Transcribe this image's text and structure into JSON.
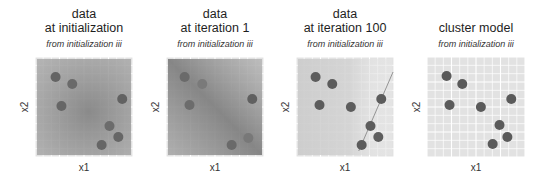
{
  "figure": {
    "point_color": "#5c5c5c",
    "point_radius": 5,
    "grid_bg": "#e2e2e2",
    "grid_line": "#ffffff",
    "boundary_color": "#8a8a8a"
  },
  "chart_data": [
    {
      "type": "scatter",
      "title": "data at initialization",
      "title_lines": [
        "data",
        "at initialization"
      ],
      "subtitle": "from initialization iii",
      "xlabel": "x1",
      "ylabel": "x2",
      "grid": true,
      "xlim": [
        0,
        1
      ],
      "ylim": [
        0,
        1
      ],
      "background": "radial-shading",
      "shading": {
        "kind": "radial",
        "cx": 0.55,
        "cy": 0.55,
        "r": 0.75,
        "stops": [
          [
            "0",
            "#828282",
            0.92
          ],
          [
            "1",
            "#a6a6a6",
            0.78
          ]
        ]
      },
      "points": [
        {
          "x": 0.21,
          "y": 0.8,
          "color": "#646464"
        },
        {
          "x": 0.38,
          "y": 0.73,
          "color": "#6a6a6a"
        },
        {
          "x": 0.27,
          "y": 0.51,
          "color": "#666666"
        },
        {
          "x": 0.89,
          "y": 0.58,
          "color": "#626262"
        },
        {
          "x": 0.76,
          "y": 0.31,
          "color": "#6c6c6c"
        },
        {
          "x": 0.85,
          "y": 0.2,
          "color": "#666666"
        },
        {
          "x": 0.68,
          "y": 0.12,
          "color": "#666666"
        }
      ]
    },
    {
      "type": "scatter",
      "title": "data at iteration 1",
      "title_lines": [
        "data",
        "at iteration 1"
      ],
      "subtitle": "from initialization iii",
      "xlabel": "x1",
      "ylabel": "x2",
      "grid": true,
      "xlim": [
        0,
        1
      ],
      "ylim": [
        0,
        1
      ],
      "background": "diagonal-shading",
      "shading": {
        "kind": "linear",
        "x1": 0,
        "y1": 1,
        "x2": 1,
        "y2": 0,
        "stops": [
          [
            "0",
            "#a6a6a6",
            0.85
          ],
          [
            "0.5",
            "#7e7e7e",
            0.92
          ],
          [
            "1",
            "#b4b4b4",
            0.8
          ]
        ]
      },
      "points": [
        {
          "x": 0.19,
          "y": 0.8,
          "color": "#6a6a6a"
        },
        {
          "x": 0.37,
          "y": 0.73,
          "color": "#7a7a7a"
        },
        {
          "x": 0.24,
          "y": 0.52,
          "color": "#6c6c6c"
        },
        {
          "x": 0.88,
          "y": 0.58,
          "color": "#606060"
        },
        {
          "x": 0.84,
          "y": 0.19,
          "color": "#787878"
        },
        {
          "x": 0.67,
          "y": 0.12,
          "color": "#6a6a6a"
        }
      ]
    },
    {
      "type": "scatter",
      "title": "data at iteration 100",
      "title_lines": [
        "data",
        "at iteration 100"
      ],
      "subtitle": "from initialization iii",
      "xlabel": "x1",
      "ylabel": "x2",
      "grid": true,
      "xlim": [
        0,
        1
      ],
      "ylim": [
        0,
        1
      ],
      "background": "light-shading",
      "shading": {
        "kind": "linear",
        "x1": 0,
        "y1": 0,
        "x2": 1,
        "y2": 0,
        "stops": [
          [
            "0",
            "#cbcbcb",
            0.9
          ],
          [
            "0.55",
            "#d2d2d2",
            0.85
          ],
          [
            "0.8",
            "#e3e3e3",
            0.6
          ],
          [
            "1",
            "#e6e6e6",
            0.5
          ]
        ]
      },
      "decision_boundary": {
        "x1": 0.64,
        "y1": 0.06,
        "x2": 0.99,
        "y2": 0.85
      },
      "points": [
        {
          "x": 0.2,
          "y": 0.8,
          "color": "#5c5c5c"
        },
        {
          "x": 0.37,
          "y": 0.73,
          "color": "#5c5c5c"
        },
        {
          "x": 0.24,
          "y": 0.52,
          "color": "#5c5c5c"
        },
        {
          "x": 0.56,
          "y": 0.5,
          "color": "#5c5c5c"
        },
        {
          "x": 0.87,
          "y": 0.58,
          "color": "#5c5c5c"
        },
        {
          "x": 0.76,
          "y": 0.31,
          "color": "#5c5c5c"
        },
        {
          "x": 0.84,
          "y": 0.2,
          "color": "#5c5c5c"
        },
        {
          "x": 0.67,
          "y": 0.12,
          "color": "#5c5c5c"
        }
      ]
    },
    {
      "type": "scatter",
      "title": "cluster model",
      "title_lines": [
        "cluster model"
      ],
      "subtitle": "from initialization iii",
      "xlabel": "x1",
      "ylabel": "x2",
      "grid": true,
      "xlim": [
        0,
        1
      ],
      "ylim": [
        0,
        1
      ],
      "background": "flat",
      "points": [
        {
          "x": 0.2,
          "y": 0.81,
          "color": "#5a5a5a"
        },
        {
          "x": 0.36,
          "y": 0.73,
          "color": "#5a5a5a"
        },
        {
          "x": 0.23,
          "y": 0.52,
          "color": "#5a5a5a"
        },
        {
          "x": 0.55,
          "y": 0.5,
          "color": "#5a5a5a"
        },
        {
          "x": 0.86,
          "y": 0.58,
          "color": "#5a5a5a"
        },
        {
          "x": 0.74,
          "y": 0.32,
          "color": "#5a5a5a"
        },
        {
          "x": 0.82,
          "y": 0.2,
          "color": "#5a5a5a"
        },
        {
          "x": 0.67,
          "y": 0.13,
          "color": "#5a5a5a"
        }
      ]
    }
  ]
}
